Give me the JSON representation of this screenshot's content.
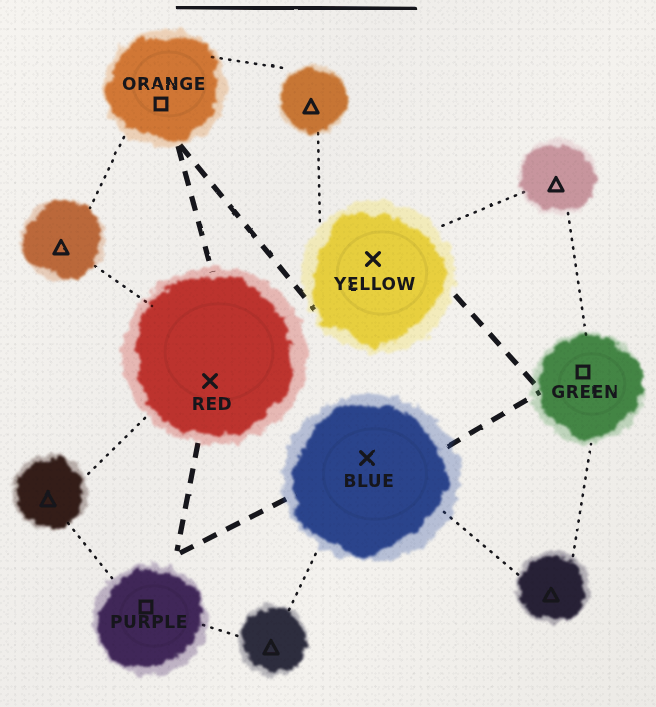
{
  "title_rule": {
    "name": "title-underline",
    "x1": 178,
    "y1": 7,
    "x2": 415,
    "y2": 9
  },
  "background": {
    "paper_color": "#f2f0ec",
    "ink_color": "#17161a"
  },
  "legend": {
    "marker_glyphs": {
      "x": "✕",
      "square": "□",
      "triangle": "△"
    }
  },
  "chart_data": {
    "type": "scatter",
    "title": "",
    "subtitle": "",
    "xlabel": "",
    "ylabel": "",
    "grid": false,
    "legend_position": "none",
    "xlim": [
      0,
      656
    ],
    "ylim": [
      0,
      707
    ],
    "nodes": [
      {
        "id": "orange",
        "label": "ORANGE",
        "marker": "square",
        "color": "#e08a3c",
        "cx": 165,
        "cy": 88,
        "rx": 58,
        "ry": 55,
        "label_x": 164,
        "label_y": 90,
        "marker_x": 161,
        "marker_y": 104,
        "size_class": "large"
      },
      {
        "id": "yellow",
        "label": "YELLOW",
        "marker": "x",
        "color": "#f4e04a",
        "cx": 378,
        "cy": 277,
        "rx": 72,
        "ry": 71,
        "label_x": 375,
        "label_y": 290,
        "marker_x": 373,
        "marker_y": 259,
        "size_class": "large"
      },
      {
        "id": "red",
        "label": "RED",
        "marker": "x",
        "color": "#d03a34",
        "cx": 215,
        "cy": 356,
        "rx": 87,
        "ry": 83,
        "label_x": 212,
        "label_y": 410,
        "marker_x": 210,
        "marker_y": 381,
        "size_class": "large"
      },
      {
        "id": "blue",
        "label": "BLUE",
        "marker": "x",
        "color": "#2d4fa2",
        "cx": 371,
        "cy": 478,
        "rx": 83,
        "ry": 78,
        "label_x": 369,
        "label_y": 487,
        "marker_x": 367,
        "marker_y": 458,
        "size_class": "large"
      },
      {
        "id": "green",
        "label": "GREEN",
        "marker": "square",
        "color": "#4f9a52",
        "cx": 588,
        "cy": 388,
        "rx": 53,
        "ry": 52,
        "label_x": 585,
        "label_y": 398,
        "marker_x": 583,
        "marker_y": 372,
        "size_class": "large"
      },
      {
        "id": "purple",
        "label": "PURPLE",
        "marker": "square",
        "color": "#4b2b6b",
        "cx": 150,
        "cy": 620,
        "rx": 54,
        "ry": 52,
        "label_x": 149,
        "label_y": 628,
        "marker_x": 146,
        "marker_y": 607,
        "size_class": "large"
      },
      {
        "id": "node-top-right",
        "label": "",
        "marker": "triangle",
        "color": "#d98a3e",
        "cx": 313,
        "cy": 100,
        "rx": 33,
        "ry": 33,
        "marker_x": 311,
        "marker_y": 107,
        "size_class": "small"
      },
      {
        "id": "node-left",
        "label": "",
        "marker": "triangle",
        "color": "#cc7a44",
        "cx": 63,
        "cy": 240,
        "rx": 40,
        "ry": 38,
        "marker_x": 61,
        "marker_y": 248,
        "size_class": "small"
      },
      {
        "id": "node-upper-right",
        "label": "",
        "marker": "triangle",
        "color": "#d7a9b3",
        "cx": 558,
        "cy": 177,
        "rx": 37,
        "ry": 36,
        "marker_x": 556,
        "marker_y": 185,
        "size_class": "small"
      },
      {
        "id": "node-bottom-left",
        "label": "",
        "marker": "triangle",
        "color": "#3a1f18",
        "cx": 50,
        "cy": 492,
        "rx": 36,
        "ry": 35,
        "marker_x": 48,
        "marker_y": 500,
        "size_class": "small"
      },
      {
        "id": "node-bottom-center",
        "label": "",
        "marker": "triangle",
        "color": "#33304a",
        "cx": 273,
        "cy": 640,
        "rx": 33,
        "ry": 34,
        "marker_x": 271,
        "marker_y": 648,
        "size_class": "small"
      },
      {
        "id": "node-bottom-right",
        "label": "",
        "marker": "triangle",
        "color": "#2a2340",
        "cx": 553,
        "cy": 587,
        "rx": 35,
        "ry": 34,
        "marker_x": 551,
        "marker_y": 595,
        "size_class": "small"
      }
    ],
    "edges": [
      {
        "id": "orange-red",
        "from": "orange",
        "to": "red",
        "style": "dashed",
        "path": "M 178,146 L 212,272"
      },
      {
        "id": "orange-yellow",
        "from": "orange",
        "to": "yellow",
        "style": "dashed",
        "path": "M 180,145 L 315,310"
      },
      {
        "id": "yellow-green",
        "from": "yellow",
        "to": "green",
        "style": "dashed",
        "path": "M 455,295 L 540,390"
      },
      {
        "id": "blue-green",
        "from": "blue",
        "to": "green",
        "style": "dashed",
        "path": "M 447,447 L 540,392"
      },
      {
        "id": "red-purple",
        "from": "red",
        "to": "purple",
        "style": "dashed",
        "path": "M 198,443 L 177,551"
      },
      {
        "id": "purple-blue",
        "from": "purple",
        "to": "blue",
        "style": "dashed",
        "path": "M 180,553 L 296,494"
      },
      {
        "id": "orange-topright",
        "from": "orange",
        "to": "node-top-right",
        "style": "dotted",
        "path": "M 212,57 L 283,68"
      },
      {
        "id": "orange-left",
        "from": "orange",
        "to": "node-left",
        "style": "dotted",
        "path": "M 124,137 L 90,208"
      },
      {
        "id": "topright-yellow",
        "from": "node-top-right",
        "to": "yellow",
        "style": "dotted",
        "path": "M 318,133 L 320,227"
      },
      {
        "id": "left-red",
        "from": "node-left",
        "to": "red",
        "style": "dotted",
        "path": "M 95,266 L 152,306"
      },
      {
        "id": "upperright-yellow",
        "from": "node-upper-right",
        "to": "yellow",
        "style": "dotted",
        "path": "M 524,192 L 437,228"
      },
      {
        "id": "upperright-green",
        "from": "node-upper-right",
        "to": "green",
        "style": "dotted",
        "path": "M 568,213 L 586,335"
      },
      {
        "id": "red-bottomleft",
        "from": "red",
        "to": "node-bottom-left",
        "style": "dotted",
        "path": "M 145,418 L 84,478"
      },
      {
        "id": "bottomleft-purple",
        "from": "node-bottom-left",
        "to": "purple",
        "style": "dotted",
        "path": "M 68,523 L 112,578"
      },
      {
        "id": "purple-bottomcenter",
        "from": "purple",
        "to": "node-bottom-center",
        "style": "dotted",
        "path": "M 203,625 L 241,637"
      },
      {
        "id": "bottomcenter-blue",
        "from": "node-bottom-center",
        "to": "blue",
        "style": "dotted",
        "path": "M 289,610 L 318,549"
      },
      {
        "id": "blue-bottomright",
        "from": "blue",
        "to": "node-bottom-right",
        "style": "dotted",
        "path": "M 444,512 L 521,577"
      },
      {
        "id": "bottomright-green",
        "from": "node-bottom-right",
        "to": "green",
        "style": "dotted",
        "path": "M 573,556 L 591,444"
      }
    ]
  }
}
